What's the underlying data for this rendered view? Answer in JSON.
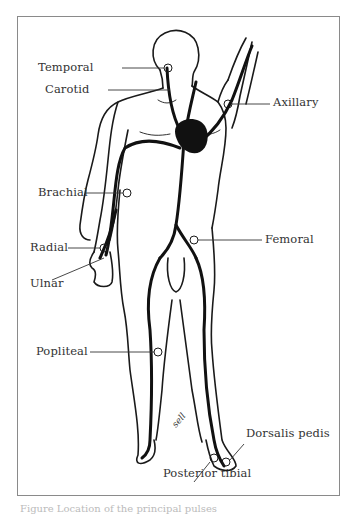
{
  "figure": {
    "labels": {
      "temporal": "Temporal",
      "carotid": "Carotid",
      "axillary": "Axillary",
      "brachial": "Brachial",
      "radial": "Radial",
      "ulnar": "Ulnar",
      "femoral": "Femoral",
      "popliteal": "Popliteal",
      "dorsalis_pedis": "Dorsalis pedis",
      "posterior_tibial": "Posterior tibial"
    },
    "signature": "sell",
    "caption": "Figure  Location of the principal pulses"
  },
  "colors": {
    "frame": "#8a8a8a",
    "ink": "#1a1a1a",
    "label": "#333333"
  }
}
